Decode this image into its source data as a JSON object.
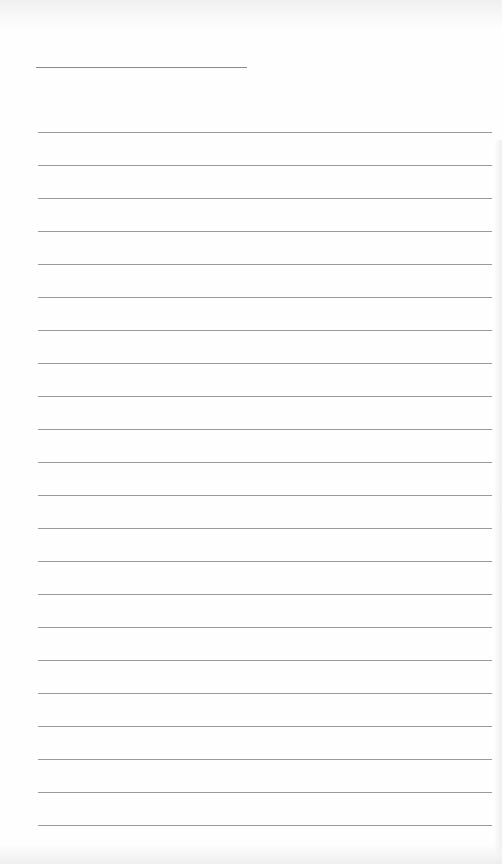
{
  "document": {
    "type": "blank lined paper",
    "header_line": {
      "label": ""
    },
    "ruled_line_count": 22,
    "lines": [
      "",
      "",
      "",
      "",
      "",
      "",
      "",
      "",
      "",
      "",
      "",
      "",
      "",
      "",
      "",
      "",
      "",
      "",
      "",
      "",
      "",
      ""
    ],
    "colors": {
      "paper": "#fefefe",
      "rule": "#9a9a9a",
      "header_rule": "#8a8a8a"
    }
  }
}
